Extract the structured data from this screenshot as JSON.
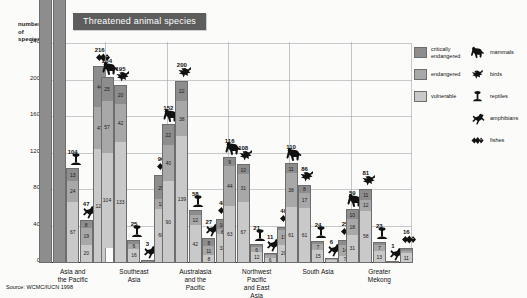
{
  "title": "Threatened animal species",
  "source": "Source: WCMC/IUCN 1998",
  "axis": {
    "ylabel_line1": "number",
    "ylabel_line2": "of",
    "ylabel_line3": "species",
    "ticks": [
      "240",
      "200",
      "160",
      "120",
      "80",
      "40",
      "0"
    ]
  },
  "legend": {
    "categories": [
      {
        "key": "crit",
        "label": "critically\nendangered"
      },
      {
        "key": "endg",
        "label": "endangered"
      },
      {
        "key": "vuln",
        "label": "vulnerable"
      }
    ],
    "taxa": [
      {
        "icon": "mammals-icon",
        "label": "mammals"
      },
      {
        "icon": "birds-icon",
        "label": "birds"
      },
      {
        "icon": "reptiles-icon",
        "label": "reptiles"
      },
      {
        "icon": "amphibians-icon",
        "label": "amphibians"
      },
      {
        "icon": "fishes-icon",
        "label": "fishes"
      }
    ]
  },
  "chart_data": {
    "type": "bar",
    "subtype": "grouped-stacked",
    "title": "Threatened animal species",
    "xlabel": "",
    "ylabel": "number of species",
    "ylim": [
      0,
      240
    ],
    "yticks": [
      0,
      40,
      80,
      120,
      160,
      200,
      240
    ],
    "grid": true,
    "legend_position": "right",
    "stack_order": [
      "critically endangered",
      "endangered",
      "vulnerable"
    ],
    "categories": [
      "Asia and\nthe Pacific",
      "Southeast Asia",
      "Australasia\nand the Pacific",
      "Northwest Pacific\nand East Asia",
      "South Asia",
      "Greater Mekong"
    ],
    "groups": [
      {
        "name": "Asia and\nthe Pacific",
        "bars": [
          {
            "taxon": "mammals",
            "icon": "mammals-icon",
            "total": 260,
            "clipped": true,
            "segments": []
          },
          {
            "taxon": "birds",
            "icon": "birds-icon",
            "total": 283,
            "clipped": true,
            "segments": []
          },
          {
            "taxon": "reptiles",
            "icon": "reptiles-icon",
            "total": 104,
            "clipped": false,
            "segments": [
              13,
              24,
              67
            ]
          },
          {
            "taxon": "amphibians",
            "icon": "amphibians-icon",
            "total": 47,
            "clipped": false,
            "segments": [
              8,
              19,
              20
            ]
          },
          {
            "taxon": "fishes",
            "icon": "fishes-icon",
            "total": 216,
            "clipped": false,
            "segments": [
              44,
              47,
              125
            ]
          }
        ]
      },
      {
        "name": "Southeast Asia",
        "bars": [
          {
            "taxon": "mammals",
            "icon": "mammals-icon",
            "total": 204,
            "clipped": false,
            "segments": [
              25,
              57,
              104
            ]
          },
          {
            "taxon": "birds",
            "icon": "birds-icon",
            "total": 195,
            "clipped": false,
            "segments": [
              20,
              42,
              133
            ]
          },
          {
            "taxon": "reptiles",
            "icon": "reptiles-icon",
            "total": 25,
            "clipped": false,
            "segments": [
              3,
              6,
              16
            ]
          },
          {
            "taxon": "amphibians",
            "icon": "amphibians-icon",
            "total": 3,
            "clipped": false,
            "segments": [
              1,
              1,
              1
            ]
          },
          {
            "taxon": "fishes",
            "icon": "fishes-icon",
            "total": 96,
            "clipped": false,
            "segments": [
              25,
              11,
              60
            ]
          }
        ]
      },
      {
        "name": "Australasia\nand the Pacific",
        "bars": [
          {
            "taxon": "mammals",
            "icon": "mammals-icon",
            "total": 152,
            "clipped": false,
            "segments": [
              22,
              40,
              90
            ]
          },
          {
            "taxon": "birds",
            "icon": "birds-icon",
            "total": 200,
            "clipped": false,
            "segments": [
              22,
              38,
              139
            ]
          },
          {
            "taxon": "reptiles",
            "icon": "reptiles-icon",
            "total": 58,
            "clipped": false,
            "segments": [
              4,
              12,
              42
            ]
          },
          {
            "taxon": "amphibians",
            "icon": "amphibians-icon",
            "total": 27,
            "clipped": false,
            "segments": [
              8,
              11,
              8
            ]
          },
          {
            "taxon": "fishes",
            "icon": "fishes-icon",
            "total": 48,
            "clipped": false,
            "segments": [
              10,
              6,
              32
            ]
          }
        ]
      },
      {
        "name": "Northwest Pacific\nand East Asia",
        "bars": [
          {
            "taxon": "mammals",
            "icon": "mammals-icon",
            "total": 116,
            "clipped": false,
            "segments": [
              9,
              44,
              63
            ]
          },
          {
            "taxon": "birds",
            "icon": "birds-icon",
            "total": 108,
            "clipped": false,
            "segments": [
              10,
              31,
              67
            ]
          },
          {
            "taxon": "reptiles",
            "icon": "reptiles-icon",
            "total": 21,
            "clipped": false,
            "segments": [
              3,
              6,
              12
            ]
          },
          {
            "taxon": "amphibians",
            "icon": "amphibians-icon",
            "total": 11,
            "clipped": false,
            "segments": [
              1,
              4,
              6
            ]
          },
          {
            "taxon": "fishes",
            "icon": "fishes-icon",
            "total": 40,
            "clipped": false,
            "segments": [
              3,
              17,
              20
            ]
          }
        ]
      },
      {
        "name": "South Asia",
        "bars": [
          {
            "taxon": "mammals",
            "icon": "mammals-icon",
            "total": 110,
            "clipped": false,
            "segments": [
              11,
              38,
              61
            ]
          },
          {
            "taxon": "birds",
            "icon": "birds-icon",
            "total": 86,
            "clipped": false,
            "segments": [
              8,
              17,
              61
            ]
          },
          {
            "taxon": "reptiles",
            "icon": "reptiles-icon",
            "total": 24,
            "clipped": false,
            "segments": [
              2,
              7,
              15
            ]
          },
          {
            "taxon": "amphibians",
            "icon": "amphibians-icon",
            "total": 6,
            "clipped": false,
            "segments": [
              1,
              2,
              3
            ]
          },
          {
            "taxon": "fishes",
            "icon": "fishes-icon",
            "total": 25,
            "clipped": false,
            "segments": [
              4,
              14,
              7
            ]
          }
        ]
      },
      {
        "name": "Greater Mekong",
        "bars": [
          {
            "taxon": "mammals",
            "icon": "mammals-icon",
            "total": 59,
            "clipped": false,
            "segments": [
              10,
              18,
              31
            ]
          },
          {
            "taxon": "birds",
            "icon": "birds-icon",
            "total": 81,
            "clipped": false,
            "segments": [
              11,
              12,
              58
            ]
          },
          {
            "taxon": "reptiles",
            "icon": "reptiles-icon",
            "total": 23,
            "clipped": false,
            "segments": [
              3,
              7,
              13
            ]
          },
          {
            "taxon": "amphibians",
            "icon": "amphibians-icon",
            "total": 1,
            "clipped": false,
            "segments": [
              1,
              0,
              0
            ]
          },
          {
            "taxon": "fishes",
            "icon": "fishes-icon",
            "total": 16,
            "clipped": false,
            "segments": [
              2,
              3,
              11
            ]
          }
        ]
      }
    ]
  }
}
